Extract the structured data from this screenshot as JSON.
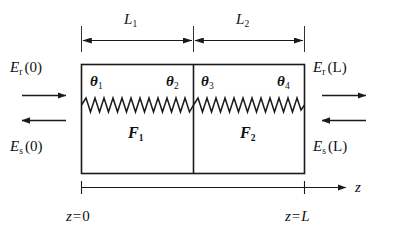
{
  "figure": {
    "type": "physics-schematic"
  },
  "dimensions": {
    "left_label": "L",
    "left_sub": "1",
    "right_label": "L",
    "right_sub": "2"
  },
  "fields": {
    "left_top": {
      "symbol": "E",
      "sub": "r",
      "arg": "(0)"
    },
    "left_bottom": {
      "symbol": "E",
      "sub": "s",
      "arg": "(0)"
    },
    "right_top": {
      "symbol": "E",
      "sub": "r",
      "arg": "(L)"
    },
    "right_bottom": {
      "symbol": "E",
      "sub": "s",
      "arg": "(L)"
    }
  },
  "angles": [
    {
      "symbol": "θ",
      "sub": "1"
    },
    {
      "symbol": "θ",
      "sub": "2"
    },
    {
      "symbol": "θ",
      "sub": "3"
    },
    {
      "symbol": "θ",
      "sub": "4"
    }
  ],
  "layers": [
    {
      "symbol": "F",
      "sub": "1"
    },
    {
      "symbol": "F",
      "sub": "2"
    }
  ],
  "axis": {
    "name": "z",
    "start_label": {
      "lhs": "z",
      "eq": "=",
      "rhs": "0"
    },
    "end_label": {
      "lhs": "z",
      "eq": "=",
      "rhs": "L"
    }
  },
  "colors": {
    "stroke": "#1a1a1a",
    "background": "#ffffff"
  }
}
